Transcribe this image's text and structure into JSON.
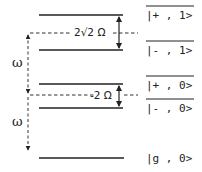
{
  "diagram": {
    "type": "energy-level-diagram",
    "levels": [
      {
        "id": "plus-1",
        "label": "|+ , 1>",
        "overlined": true
      },
      {
        "id": "minus-1",
        "label": "|- , 1>",
        "overlined": true
      },
      {
        "id": "plus-0",
        "label": "|+ , 0>",
        "overlined": true
      },
      {
        "id": "minus-0",
        "label": "|- , 0>",
        "overlined": true
      },
      {
        "id": "g-0",
        "label": "|g , 0>",
        "overlined": false
      }
    ],
    "splittings": [
      {
        "between": [
          "plus-1",
          "minus-1"
        ],
        "label": "2√2 Ω"
      },
      {
        "between": [
          "plus-0",
          "minus-0"
        ],
        "label": "-2 Ω"
      }
    ],
    "transitions": [
      {
        "from": "upper-center",
        "to": "lower-center",
        "label": "ω"
      },
      {
        "from": "lower-center",
        "to": "g-0",
        "label": "ω"
      }
    ]
  }
}
